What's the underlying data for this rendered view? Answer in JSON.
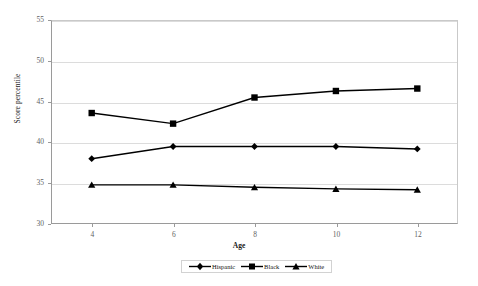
{
  "chart_data": {
    "type": "line",
    "title": "",
    "xlabel": "Age",
    "ylabel": "Score percentile",
    "x": [
      4,
      6,
      8,
      10,
      12
    ],
    "xticklabels": [
      "4",
      "6",
      "8",
      "10",
      "12"
    ],
    "yticklabels": [
      "30",
      "35",
      "40",
      "45",
      "50",
      "55"
    ],
    "yticks": [
      30,
      35,
      40,
      45,
      50,
      55
    ],
    "ylim": [
      30,
      55
    ],
    "xlim": [
      3,
      13
    ],
    "grid": "horizontal",
    "legend_position": "bottom-center",
    "series": [
      {
        "name": "Hispanic",
        "marker": "diamond",
        "color": "#000000",
        "values": [
          38.0,
          39.5,
          39.5,
          39.5,
          39.2
        ]
      },
      {
        "name": "Black",
        "marker": "square",
        "color": "#000000",
        "values": [
          43.6,
          42.3,
          45.5,
          46.3,
          46.6
        ]
      },
      {
        "name": "White",
        "marker": "triangle",
        "color": "#000000",
        "values": [
          34.8,
          34.8,
          34.5,
          34.3,
          34.2
        ]
      }
    ]
  },
  "axes": {
    "y_title": "Score percentile",
    "x_title": "Age"
  },
  "legend": {
    "items": [
      {
        "label": "Hispanic",
        "marker": "diamond"
      },
      {
        "label": "Black",
        "marker": "square"
      },
      {
        "label": "White",
        "marker": "triangle"
      }
    ]
  },
  "colors": {
    "series": "#000000",
    "grid": "#dcdcdc",
    "axis": "#9a9a9a",
    "tick_text": "#5f5f5f",
    "background": "#ffffff"
  }
}
